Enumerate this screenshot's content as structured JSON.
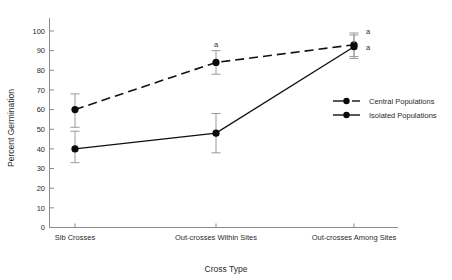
{
  "chart_data": {
    "type": "line",
    "title": "",
    "xlabel": "Cross Type",
    "ylabel": "Percent Germination",
    "categories": [
      "Sib Crosses",
      "Out-crosses Within Sites",
      "Out-crosses Among Sites"
    ],
    "ylim": [
      0,
      100
    ],
    "yticks": [
      0,
      10,
      20,
      30,
      40,
      50,
      60,
      70,
      80,
      90,
      100
    ],
    "ytick_labels": [
      "0",
      "10",
      "20",
      "30",
      "40",
      "50",
      "60",
      "70",
      "80",
      "90",
      "100"
    ],
    "grid": false,
    "legend_position": "center-right",
    "series": [
      {
        "name": "Central Populations",
        "style": "dashed",
        "marker": "filled-circle",
        "values": [
          60,
          84,
          93
        ],
        "err_low": [
          51,
          78,
          87
        ],
        "err_high": [
          68,
          90,
          99
        ]
      },
      {
        "name": "Isolated Populations",
        "style": "solid",
        "marker": "filled-circle",
        "values": [
          40,
          48,
          92
        ],
        "err_low": [
          33,
          38,
          86
        ],
        "err_high": [
          49,
          58,
          98
        ]
      }
    ],
    "annotations": [
      {
        "text": "a",
        "category": "Out-crosses Within Sites",
        "value": 91,
        "series": "Central Populations"
      },
      {
        "text": "a",
        "category": "Out-crosses Among Sites",
        "value": 100,
        "series": "Central Populations"
      },
      {
        "text": "a",
        "category": "Out-crosses Among Sites",
        "value": 92,
        "series": "Isolated Populations"
      }
    ]
  },
  "legend": {
    "entries": [
      {
        "label": "Central Populations",
        "style": "dashed"
      },
      {
        "label": "Isolated Populations",
        "style": "solid"
      }
    ]
  }
}
